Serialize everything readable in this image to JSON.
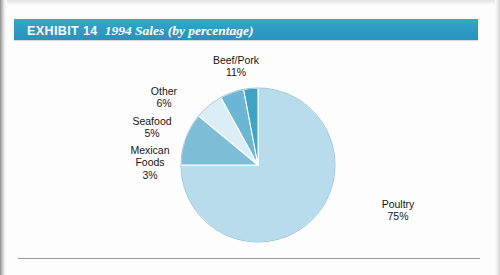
{
  "page": {
    "background_color": "#fdfdfd",
    "rule_color": "#9a9a9a"
  },
  "title": {
    "banner_color": "#2e9cc4",
    "text_color": "#ffffff",
    "exhibit_label": "EXHIBIT 14",
    "caption": "1994 Sales (by percentage)"
  },
  "chart_data": {
    "type": "pie",
    "title": "1994 Sales (by percentage)",
    "xlabel": "",
    "ylabel": "",
    "legend_position": "none",
    "grid": false,
    "start_angle_deg": 0,
    "direction": "counterclockwise",
    "categories": [
      "Poultry",
      "Beef/Pork",
      "Other",
      "Seafood",
      "Mexican Foods"
    ],
    "values": [
      75,
      11,
      6,
      5,
      3
    ],
    "value_unit": "%",
    "colors": [
      "#b8dcec",
      "#7dbdd8",
      "#dceef5",
      "#6ab6d4",
      "#3fa3c4"
    ],
    "slices": [
      {
        "name": "Poultry",
        "value": 75,
        "label_line1": "Poultry",
        "label_line2": "",
        "label_pct": "75%",
        "color": "#b8dcec"
      },
      {
        "name": "Beef/Pork",
        "value": 11,
        "label_line1": "Beef/Pork",
        "label_line2": "",
        "label_pct": "11%",
        "color": "#7dbdd8"
      },
      {
        "name": "Other",
        "value": 6,
        "label_line1": "Other",
        "label_line2": "",
        "label_pct": "6%",
        "color": "#dceef5"
      },
      {
        "name": "Seafood",
        "value": 5,
        "label_line1": "Seafood",
        "label_line2": "",
        "label_pct": "5%",
        "color": "#6ab6d4"
      },
      {
        "name": "Mexican Foods",
        "value": 3,
        "label_line1": "Mexican",
        "label_line2": "Foods",
        "label_pct": "3%",
        "color": "#3fa3c4"
      }
    ]
  }
}
